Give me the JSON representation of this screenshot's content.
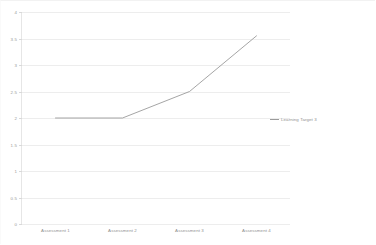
{
  "chart_data": {
    "type": "line",
    "title": "",
    "xlabel": "",
    "ylabel": "",
    "categories": [
      "Assessment 1",
      "Assessment 2",
      "Assessment 3",
      "Assessment 4"
    ],
    "series": [
      {
        "name": "Learning Target 3",
        "values": [
          2,
          2,
          2.5,
          3.55
        ],
        "color": "#9b9b9b"
      }
    ],
    "ylim": [
      0,
      4
    ],
    "ytick_values": [
      0,
      0.5,
      1,
      1.5,
      2,
      2.5,
      3,
      3.5,
      4
    ],
    "ytick_labels": [
      "0",
      "0.5",
      "1",
      "1.5",
      "2",
      "2.5",
      "3",
      "3.5",
      "4"
    ],
    "grid": true,
    "grid_color": "#ededed",
    "legend_position": "right",
    "background": "#ffffff"
  },
  "legend": {
    "entries": [
      {
        "label": "Learning Target 3"
      }
    ]
  }
}
